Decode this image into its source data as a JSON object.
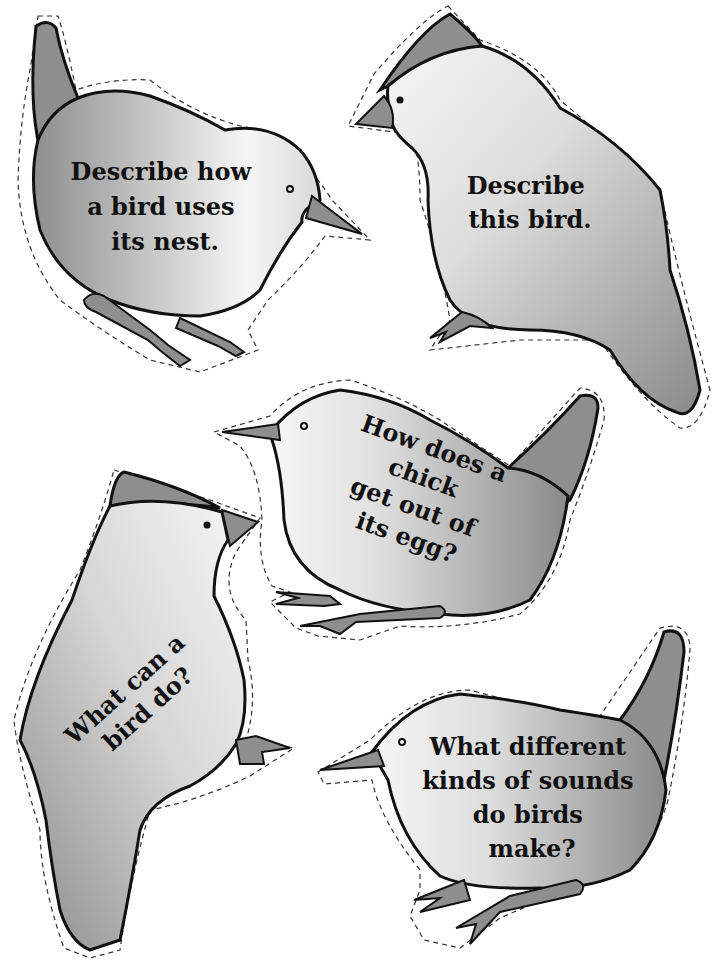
{
  "page": {
    "background": "#ffffff"
  },
  "colors": {
    "body_light": "#f4f4f4",
    "body_dark": "#8e8e8e",
    "outline": "#111111",
    "cut_line": "#333333"
  },
  "cards": [
    {
      "id": "card-1",
      "lines": [
        "Describe how",
        "a bird uses",
        "its nest."
      ]
    },
    {
      "id": "card-2",
      "lines": [
        "Describe",
        "this bird."
      ]
    },
    {
      "id": "card-3",
      "lines": [
        "How does a",
        "chick",
        "get out of",
        "its egg?"
      ]
    },
    {
      "id": "card-4",
      "lines": [
        "What can a",
        "bird do?"
      ]
    },
    {
      "id": "card-5",
      "lines": [
        "What different",
        "kinds of sounds",
        "do birds",
        "make?"
      ]
    }
  ]
}
